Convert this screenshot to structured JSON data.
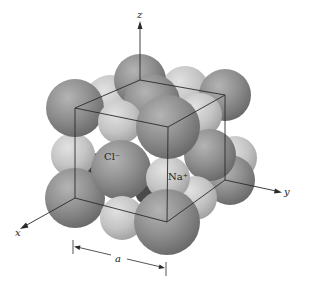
{
  "figure": {
    "ions": {
      "anion": {
        "label": "Cl⁻",
        "name": "chloride",
        "color": "#8c8c8c",
        "highlight": "#b9b9b9",
        "shadow": "#5e5e5e"
      },
      "cation": {
        "label": "Na⁺",
        "name": "sodium",
        "color": "#c6c6c6",
        "highlight": "#e4e4e4",
        "shadow": "#9a9a9a"
      }
    },
    "axes": {
      "x": "x",
      "y": "y",
      "z": "z"
    },
    "dimension": {
      "label": "a",
      "meaning": "lattice constant"
    },
    "line_color": "#2a2a2a",
    "background": "#ffffff"
  }
}
